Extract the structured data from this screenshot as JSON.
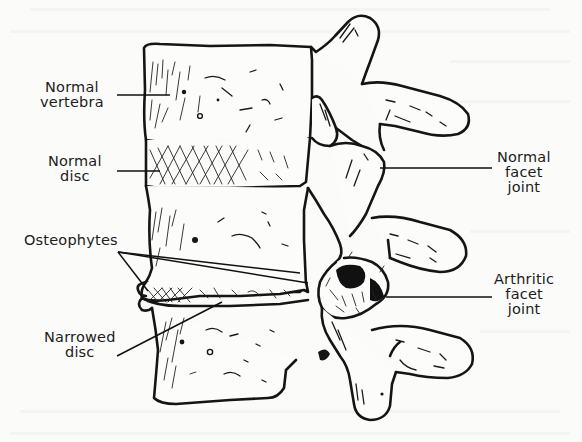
{
  "figure": {
    "labels": {
      "normal_vertebra": [
        "Normal",
        "vertebra"
      ],
      "normal_disc": [
        "Normal",
        "disc"
      ],
      "osteophytes": [
        "Osteophytes"
      ],
      "narrowed_disc": [
        "Narrowed",
        "disc"
      ],
      "normal_facet_joint": [
        "Normal",
        "facet",
        "joint"
      ],
      "arthritic_facet_joint": [
        "Arthritic",
        "facet",
        "joint"
      ]
    }
  },
  "colors": {
    "ink": "#151515",
    "paper": "#fbfbf9"
  }
}
